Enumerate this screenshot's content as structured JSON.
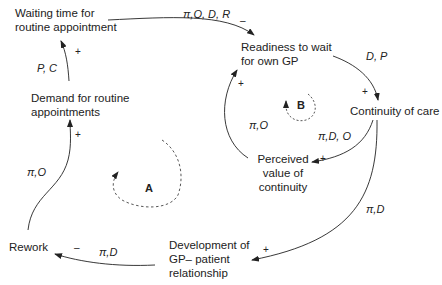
{
  "diagram": {
    "type": "causal-loop-diagram",
    "nodes": {
      "waiting_time": {
        "line1": "Waiting time for",
        "line2": "routine appointment"
      },
      "demand": {
        "line1": "Demand for routine",
        "line2": "appointments"
      },
      "readiness": {
        "line1": "Readiness to wait",
        "line2": "for own GP"
      },
      "continuity": {
        "line1": "Continuity of care"
      },
      "perceived_value": {
        "line1": "Perceived",
        "line2": "value of",
        "line3": "continuity"
      },
      "development": {
        "line1": "Development of",
        "line2": "GP– patient",
        "line3": "relationship"
      },
      "rework": {
        "line1": "Rework"
      }
    },
    "edges": [
      {
        "from": "Waiting time for routine appointment",
        "to": "Readiness to wait for own GP",
        "label": "π,O, D, R",
        "sign": "–"
      },
      {
        "from": "Readiness to wait for own GP",
        "to": "Continuity of care",
        "label": "D, P",
        "sign": "+"
      },
      {
        "from": "Continuity of care",
        "to": "Perceived value of continuity",
        "label": "π,D, O",
        "sign": "+"
      },
      {
        "from": "Perceived value of continuity",
        "to": "Readiness to wait for own GP",
        "label": "π,O",
        "sign": "+"
      },
      {
        "from": "Continuity of care",
        "to": "Development of GP–patient relationship",
        "label": "π,D",
        "sign": "+"
      },
      {
        "from": "Development of GP–patient relationship",
        "to": "Rework",
        "label": "π,D",
        "sign": "–"
      },
      {
        "from": "Rework",
        "to": "Demand for routine appointments",
        "label": "π,O",
        "sign": "+"
      },
      {
        "from": "Demand for routine appointments",
        "to": "Waiting time for routine appointment",
        "label": "P, C",
        "sign": "+"
      }
    ],
    "labels": {
      "e1": "π,O, D, R",
      "e1_sign": "–",
      "e2": "D, P",
      "e2_sign": "+",
      "e3": "π,D, O",
      "e3_sign": "+",
      "e4": "π,O",
      "e4_sign": "+",
      "e5": "π,D",
      "e5_sign": "+",
      "e6": "π,D",
      "e6_sign": "–",
      "e7": "π,O",
      "e7_sign": "+",
      "e8": "P, C",
      "e8_sign": "+"
    },
    "loops": {
      "a": "A",
      "b": "B"
    }
  }
}
